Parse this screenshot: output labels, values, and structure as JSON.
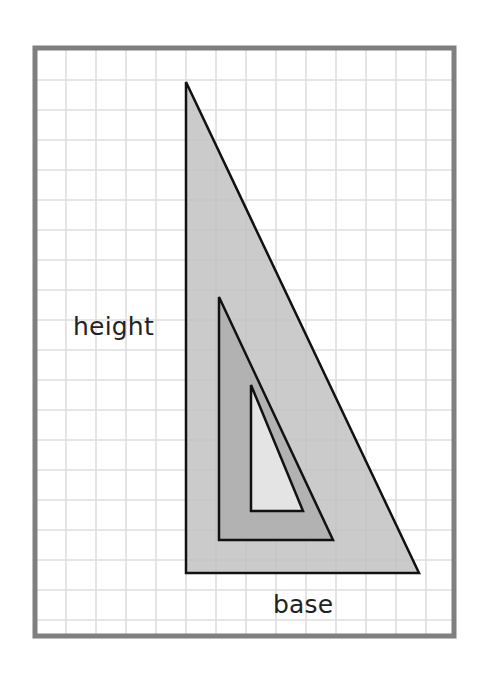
{
  "diagram": {
    "labels": {
      "height": "height",
      "base": "base"
    },
    "frame": {
      "x": 35,
      "y": 48,
      "width": 419,
      "height": 588,
      "stroke": "#7f7f7f",
      "stroke_width": 5
    },
    "grid": {
      "spacing": 30,
      "origin_x": 36,
      "origin_y": 50,
      "color": "#dedede"
    },
    "triangles": [
      {
        "name": "large-triangle",
        "points": [
          [
            186,
            82
          ],
          [
            186,
            573
          ],
          [
            419,
            573
          ]
        ],
        "fill": "#c2c2c2",
        "stroke": "#111111"
      },
      {
        "name": "medium-triangle",
        "points": [
          [
            219,
            297
          ],
          [
            219,
            540
          ],
          [
            333,
            540
          ]
        ],
        "fill": "#aeaeae",
        "stroke": "#111111"
      },
      {
        "name": "small-triangle",
        "points": [
          [
            251,
            385
          ],
          [
            251,
            511
          ],
          [
            303,
            511
          ]
        ],
        "fill": "#ececec",
        "stroke": "#111111"
      }
    ]
  }
}
